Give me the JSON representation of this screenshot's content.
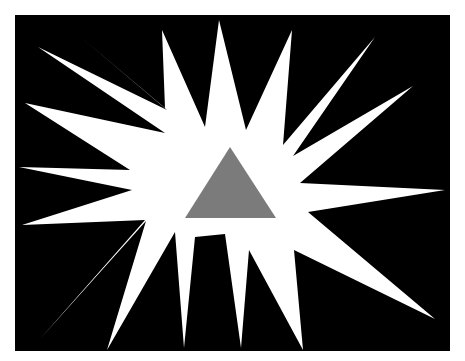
{
  "figure": {
    "background_color": "#ffffff",
    "panel_color": "#000000",
    "star_color": "#ffffff",
    "triangle_color": "#7b7b7b",
    "panel": {
      "x": 15,
      "y": 15,
      "width": 435,
      "height": 336
    },
    "star_points": "219,20 246,130 292,30 283,145 375,37 293,156 413,86 300,183 445,190 308,212 435,319 294,250 303,350 249,250 241,348 225,234 195,237 184,348 175,232 107,350 146,221 40,339 145,220 22,225 132,190 19,167 130,170 25,103 165,133 38,47 167,110 83,39 165,108 162,30 205,127",
    "triangle_points": "230,147 185,218 276,218"
  }
}
